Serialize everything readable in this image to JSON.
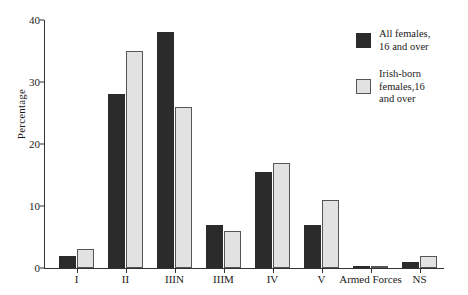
{
  "chart_data": {
    "type": "bar",
    "title": "",
    "subtitle": "",
    "xlabel": "",
    "ylabel": "Percentage",
    "ylim": [
      0,
      40
    ],
    "yticks": [
      0,
      10,
      20,
      30,
      40
    ],
    "grid": false,
    "legend_position": "right",
    "categories": [
      "I",
      "II",
      "IIIN",
      "IIIM",
      "IV",
      "V",
      "Armed Forces",
      "NS"
    ],
    "series": [
      {
        "name": "All females,\n16 and over",
        "color": "#2b2b2b",
        "values": [
          2,
          28,
          38,
          7,
          15.5,
          7,
          0.2,
          1
        ]
      },
      {
        "name": "Irish-born\nfemales,16\nand over",
        "color": "#e2e2e2",
        "values": [
          3,
          35,
          26,
          6,
          17,
          11,
          0.2,
          2
        ]
      }
    ]
  },
  "axis": {
    "y_label": "Percentage",
    "y_ticks": [
      "0",
      "10",
      "20",
      "30",
      "40"
    ],
    "x_labels": [
      "I",
      "II",
      "IIIN",
      "IIIM",
      "IV",
      "V",
      "Armed Forces",
      "NS"
    ]
  },
  "legend": {
    "items": [
      {
        "label": "All females,\n16 and over",
        "swatch": "dark"
      },
      {
        "label": "Irish-born\nfemales,16\nand over",
        "swatch": "light"
      }
    ]
  }
}
